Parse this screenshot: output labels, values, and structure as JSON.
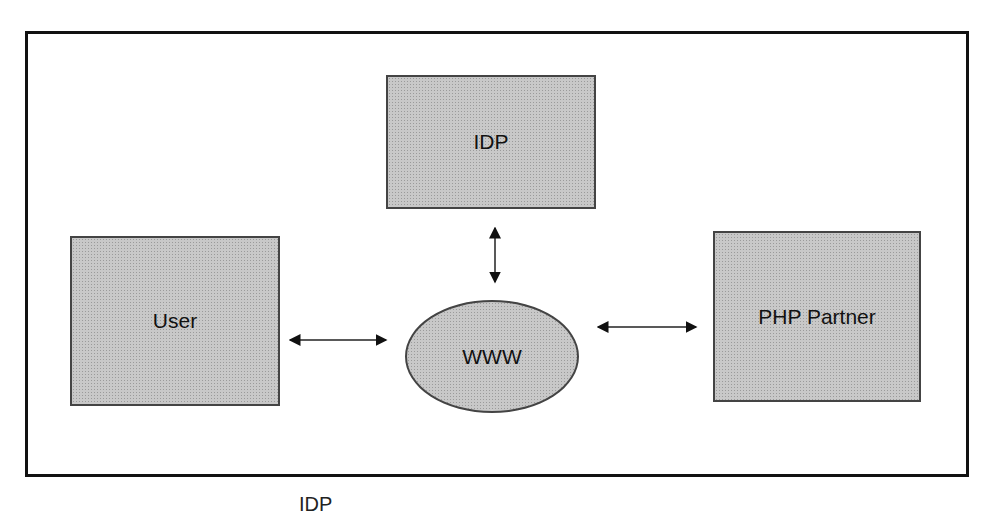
{
  "diagram": {
    "nodes": {
      "idp": {
        "label": "IDP",
        "shape": "rectangle"
      },
      "user": {
        "label": "User",
        "shape": "rectangle"
      },
      "www": {
        "label": "WWW",
        "shape": "ellipse"
      },
      "partner": {
        "label": "PHP Partner",
        "shape": "rectangle"
      }
    },
    "edges": [
      {
        "from": "idp",
        "to": "www",
        "type": "bidirectional-arrow"
      },
      {
        "from": "user",
        "to": "www",
        "type": "bidirectional-arrow"
      },
      {
        "from": "www",
        "to": "partner",
        "type": "bidirectional-arrow"
      }
    ],
    "colors": {
      "node_fill": "#c8c8c8",
      "border": "#111111"
    },
    "caption_clipped": "IDP"
  }
}
